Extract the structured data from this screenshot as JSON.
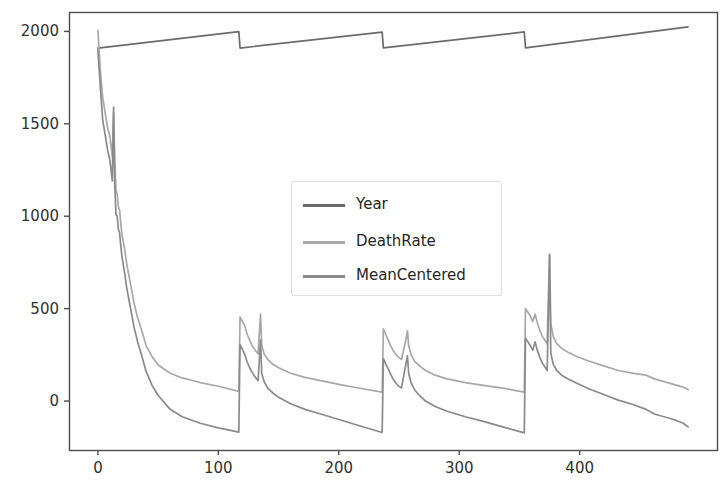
{
  "figure": {
    "background": "#ffffff",
    "width": 727,
    "height": 492
  },
  "axes": {
    "frame_color": "#4d4d4d",
    "tick_color": "#4d4d4d",
    "label_color": "#303030",
    "plot_left": 69,
    "plot_right": 717,
    "plot_top": 12,
    "plot_bottom": 450
  },
  "legend": {
    "position": "center",
    "border_color": "#e0e0e0",
    "background": "#ffffff",
    "entries": [
      {
        "label": "Year",
        "color": "#6b6b6b"
      },
      {
        "label": "DeathRate",
        "color": "#a8a8a8"
      },
      {
        "label": "MeanCentered",
        "color": "#8a8a8a"
      }
    ]
  },
  "chart_data": {
    "type": "line",
    "title": "",
    "xlabel": "",
    "ylabel": "",
    "xlim": [
      -24,
      514
    ],
    "ylim": [
      -265,
      2105
    ],
    "xticks": [
      0,
      100,
      200,
      300,
      400
    ],
    "yticks": [
      0,
      500,
      1000,
      1500,
      2000
    ],
    "grid": false,
    "legend_position": "center",
    "series": [
      {
        "name": "Year",
        "color": "#6b6b6b",
        "description": "Sawtooth: rises linearly from ~1910 to ~2000 then resets at each period boundary (x=118, 237, 355); final segment reaches ~2025.",
        "x": [
          0,
          117,
          118,
          236,
          237,
          354,
          355,
          490
        ],
        "y": [
          1910,
          1999,
          1910,
          1996,
          1911,
          1997,
          1911,
          2025
        ]
      },
      {
        "name": "DeathRate",
        "color": "#a8a8a8",
        "description": "Starts near 2000, decays steeply to a plateau near 40; jumps to ~460 at each period boundary with a secondary spike, then decays again.",
        "x": [
          0,
          2,
          4,
          6,
          8,
          10,
          12,
          13,
          14,
          15,
          16,
          17,
          18,
          19,
          20,
          22,
          24,
          26,
          28,
          30,
          33,
          36,
          40,
          45,
          50,
          60,
          70,
          85,
          100,
          117,
          118,
          120,
          122,
          124,
          126,
          128,
          130,
          133,
          135,
          136,
          138,
          141,
          145,
          150,
          160,
          172,
          185,
          200,
          215,
          236,
          237,
          239,
          241,
          243,
          245,
          247,
          249,
          252,
          255,
          257,
          258,
          260,
          263,
          267,
          272,
          280,
          290,
          305,
          320,
          336,
          354,
          355,
          357,
          359,
          361,
          363,
          365,
          367,
          369,
          371,
          373,
          375,
          376,
          378,
          381,
          385,
          390,
          398,
          408,
          420,
          432,
          445,
          455,
          462,
          470,
          478,
          486,
          490
        ],
        "y": [
          2005,
          1790,
          1640,
          1560,
          1480,
          1430,
          1320,
          1560,
          1300,
          1140,
          1120,
          1050,
          1035,
          960,
          900,
          830,
          740,
          670,
          600,
          530,
          450,
          390,
          300,
          240,
          195,
          150,
          125,
          100,
          80,
          52,
          455,
          430,
          405,
          360,
          330,
          300,
          280,
          255,
          470,
          300,
          255,
          225,
          200,
          180,
          150,
          128,
          110,
          90,
          72,
          48,
          390,
          360,
          330,
          300,
          275,
          255,
          240,
          225,
          310,
          380,
          300,
          250,
          215,
          190,
          165,
          140,
          120,
          100,
          85,
          70,
          48,
          500,
          480,
          460,
          430,
          470,
          420,
          380,
          350,
          330,
          310,
          795,
          420,
          350,
          310,
          285,
          265,
          240,
          215,
          190,
          165,
          150,
          140,
          120,
          105,
          90,
          75,
          62
        ]
      },
      {
        "name": "MeanCentered",
        "color": "#8a8a8a",
        "description": "Same shape as DeathRate shifted down by roughly 200 (mean-centred); plateau near -165, spikes to ~300 at boundaries and ~790 at x=375.",
        "x": [
          0,
          2,
          4,
          6,
          8,
          10,
          12,
          13,
          14,
          15,
          16,
          17,
          18,
          19,
          20,
          22,
          24,
          26,
          28,
          30,
          33,
          36,
          40,
          45,
          50,
          60,
          70,
          85,
          100,
          117,
          118,
          120,
          122,
          124,
          126,
          128,
          130,
          133,
          135,
          136,
          138,
          141,
          145,
          150,
          160,
          172,
          185,
          200,
          215,
          236,
          237,
          239,
          241,
          243,
          245,
          247,
          249,
          252,
          255,
          257,
          258,
          260,
          263,
          267,
          272,
          280,
          290,
          305,
          320,
          336,
          354,
          355,
          357,
          359,
          361,
          363,
          365,
          367,
          369,
          371,
          373,
          375,
          376,
          378,
          381,
          385,
          390,
          398,
          408,
          420,
          432,
          445,
          455,
          462,
          470,
          478,
          486,
          490
        ],
        "y": [
          1900,
          1700,
          1520,
          1440,
          1360,
          1300,
          1190,
          1590,
          1170,
          1010,
          1000,
          930,
          910,
          840,
          780,
          700,
          610,
          540,
          470,
          400,
          320,
          255,
          160,
          85,
          30,
          -45,
          -85,
          -120,
          -145,
          -168,
          305,
          280,
          250,
          210,
          180,
          155,
          135,
          110,
          330,
          150,
          105,
          70,
          45,
          20,
          -15,
          -45,
          -70,
          -100,
          -130,
          -170,
          230,
          200,
          175,
          145,
          120,
          100,
          85,
          70,
          175,
          245,
          150,
          100,
          60,
          30,
          0,
          -30,
          -55,
          -85,
          -110,
          -140,
          -172,
          340,
          320,
          300,
          275,
          320,
          270,
          235,
          205,
          185,
          165,
          790,
          260,
          200,
          165,
          140,
          120,
          95,
          65,
          35,
          5,
          -20,
          -45,
          -70,
          -85,
          -100,
          -120,
          -140
        ]
      }
    ]
  }
}
